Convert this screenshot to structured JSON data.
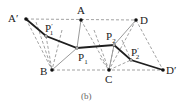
{
  "figure": {
    "caption": "(b)",
    "colors": {
      "dash": "#888888",
      "solid_gray": "#999999",
      "path": "#222222",
      "point": "#111111"
    },
    "points": {
      "A_prime": {
        "label": "A",
        "sup": "′",
        "x": 26,
        "y": 19
      },
      "A": {
        "label": "A",
        "x": 81,
        "y": 20
      },
      "D": {
        "label": "D",
        "x": 136,
        "y": 20
      },
      "B": {
        "label": "B",
        "x": 52,
        "y": 70
      },
      "C": {
        "label": "C",
        "x": 109,
        "y": 70
      },
      "D_prime": {
        "label": "D",
        "sup": "′",
        "x": 163,
        "y": 70
      },
      "P1_prime": {
        "label": "P",
        "sub": "1",
        "sup": "′",
        "x": 46,
        "y": 36
      },
      "P1": {
        "label": "P",
        "sub": "1",
        "x": 77,
        "y": 48
      },
      "P2": {
        "label": "P",
        "sub": "2",
        "x": 114,
        "y": 45
      },
      "P2_prime": {
        "label": "P",
        "sub": "2",
        "sup": "′",
        "x": 131,
        "y": 60
      }
    }
  }
}
